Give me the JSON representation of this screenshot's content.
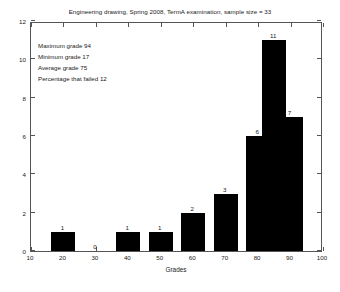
{
  "chart_data": {
    "type": "bar",
    "title": "Engineering drawing, Spring 2008, TermA examination, sample size = 33",
    "xlabel": "Grades",
    "ylabel": "",
    "categories": [
      20,
      30,
      40,
      50,
      60,
      70,
      80,
      90
    ],
    "values": [
      1,
      0,
      1,
      1,
      2,
      3,
      6,
      11
    ],
    "bars": [
      {
        "x": 20,
        "value": 1,
        "label": "1"
      },
      {
        "x": 30,
        "value": 0,
        "label": "0"
      },
      {
        "x": 40,
        "value": 1,
        "label": "1"
      },
      {
        "x": 50,
        "value": 1,
        "label": "1"
      },
      {
        "x": 60,
        "value": 2,
        "label": "2"
      },
      {
        "x": 70,
        "value": 3,
        "label": "3"
      },
      {
        "x": 80,
        "value": 6,
        "label": "6"
      },
      {
        "x": 85,
        "value": 11,
        "label": "11"
      },
      {
        "x": 90,
        "value": 7,
        "label": "7"
      }
    ],
    "xlim": [
      10,
      100
    ],
    "ylim": [
      0,
      12
    ],
    "xticks": [
      10,
      20,
      30,
      40,
      50,
      60,
      70,
      80,
      90,
      100
    ],
    "yticks": [
      0,
      2,
      4,
      6,
      8,
      10,
      12
    ],
    "grid": false,
    "legend": null,
    "bar_color": "#000000",
    "axis_color": "#555555",
    "annotations": [
      "Maximum grade 94",
      "Minimum grade 17",
      "Average grade 75",
      "Percentage that failed 12"
    ]
  },
  "stats": {
    "maximum": "Maximum grade 94",
    "minimum": "Minimum grade 17",
    "average": "Average grade 75",
    "failed": "Percentage that failed 12"
  }
}
